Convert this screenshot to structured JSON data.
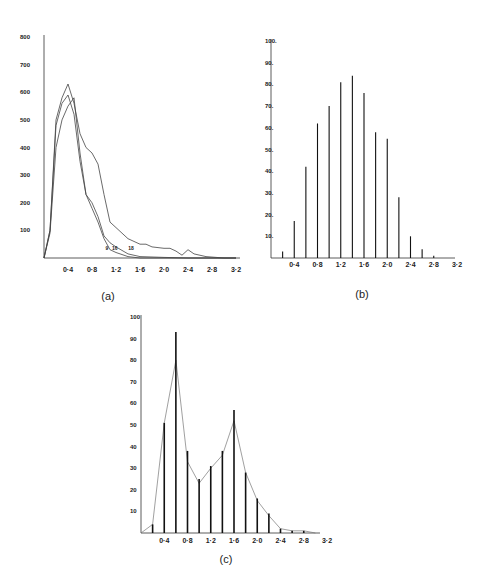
{
  "chart_data": [
    {
      "id": "a",
      "type": "line",
      "panel_label": "(a)",
      "title": "",
      "xlabel": "",
      "ylabel": "",
      "xlim": [
        0,
        3.2
      ],
      "ylim": [
        0,
        800
      ],
      "x_ticks": [
        "0·4",
        "0·8",
        "1·2",
        "1·6",
        "2·0",
        "2·4",
        "2·8",
        "3·2"
      ],
      "x_tick_values": [
        0.4,
        0.8,
        1.2,
        1.6,
        2.0,
        2.4,
        2.8,
        3.2
      ],
      "y_ticks": [
        "100",
        "200",
        "300",
        "400",
        "500",
        "600",
        "700",
        "800"
      ],
      "y_tick_values": [
        100,
        200,
        300,
        400,
        500,
        600,
        700,
        800
      ],
      "grid": false,
      "series": [
        {
          "name": "9",
          "x": [
            0,
            0.1,
            0.2,
            0.3,
            0.4,
            0.5,
            0.6,
            0.7,
            0.8,
            0.9,
            1.0,
            1.1,
            1.2,
            1.4,
            1.6,
            2.0,
            3.2
          ],
          "values": [
            0,
            100,
            480,
            560,
            590,
            520,
            350,
            230,
            180,
            130,
            70,
            30,
            20,
            5,
            0,
            0,
            0
          ],
          "label_pos": [
            1.05,
            30
          ]
        },
        {
          "name": "16",
          "x": [
            0,
            0.1,
            0.2,
            0.3,
            0.4,
            0.5,
            0.6,
            0.7,
            0.8,
            0.9,
            1.0,
            1.1,
            1.2,
            1.4,
            1.6,
            2.0,
            2.4,
            3.2
          ],
          "values": [
            0,
            90,
            400,
            500,
            550,
            580,
            380,
            230,
            200,
            150,
            80,
            55,
            40,
            15,
            5,
            2,
            0,
            0
          ],
          "label_pos": [
            1.18,
            30
          ]
        },
        {
          "name": "18",
          "x": [
            0,
            0.1,
            0.2,
            0.3,
            0.4,
            0.5,
            0.6,
            0.7,
            0.8,
            0.9,
            1.0,
            1.1,
            1.2,
            1.4,
            1.6,
            1.7,
            1.8,
            2.0,
            2.1,
            2.2,
            2.3,
            2.4,
            2.5,
            2.7,
            3.0,
            3.2
          ],
          "values": [
            0,
            100,
            500,
            580,
            630,
            560,
            450,
            400,
            380,
            340,
            230,
            130,
            110,
            70,
            50,
            50,
            40,
            35,
            35,
            25,
            10,
            30,
            15,
            5,
            0,
            0
          ],
          "label_pos": [
            1.45,
            30
          ]
        }
      ]
    },
    {
      "id": "b",
      "type": "bar",
      "panel_label": "(b)",
      "title": "",
      "xlabel": "",
      "ylabel": "",
      "xlim": [
        0,
        3.2
      ],
      "ylim": [
        0,
        100
      ],
      "x_ticks": [
        "0·4",
        "0·8",
        "1·2",
        "1·6",
        "2·0",
        "2·4",
        "2·8",
        "3·2"
      ],
      "x_tick_values": [
        0.4,
        0.8,
        1.2,
        1.6,
        2.0,
        2.4,
        2.8,
        3.2
      ],
      "y_ticks": [
        "10.",
        "20.",
        "30.",
        "40.",
        "50.",
        "60.",
        "70.",
        "80.",
        "90.",
        "100."
      ],
      "y_tick_values": [
        10,
        20,
        30,
        40,
        50,
        60,
        70,
        80,
        90,
        100
      ],
      "grid": false,
      "categories": [
        0.2,
        0.4,
        0.6,
        0.8,
        1.0,
        1.2,
        1.4,
        1.6,
        1.8,
        2.0,
        2.2,
        2.4,
        2.6,
        2.8
      ],
      "values": [
        3,
        17,
        42,
        62,
        70,
        81,
        84,
        76,
        58,
        55,
        28,
        10,
        4,
        1
      ]
    },
    {
      "id": "c",
      "type": "bar",
      "panel_label": "(c)",
      "title": "",
      "xlabel": "",
      "ylabel": "",
      "xlim": [
        0,
        3.2
      ],
      "ylim": [
        0,
        100
      ],
      "x_ticks": [
        "0·4",
        "0·8",
        "1·2",
        "1·6",
        "2·0",
        "2·4",
        "2·8",
        "3·2"
      ],
      "x_tick_values": [
        0.4,
        0.8,
        1.2,
        1.6,
        2.0,
        2.4,
        2.8,
        3.2
      ],
      "y_ticks": [
        "10",
        "20",
        "30",
        "40",
        "50",
        "60",
        "70",
        "80",
        "90",
        "100"
      ],
      "y_tick_values": [
        10,
        20,
        30,
        40,
        50,
        60,
        70,
        80,
        90,
        100
      ],
      "grid": false,
      "categories": [
        0.2,
        0.4,
        0.6,
        0.8,
        1.0,
        1.2,
        1.4,
        1.6,
        1.8,
        2.0,
        2.2,
        2.4,
        2.6,
        2.8
      ],
      "values": [
        4,
        51,
        93,
        38,
        25,
        31,
        38,
        57,
        28,
        16,
        9,
        2,
        1,
        1
      ],
      "series": [
        {
          "name": "fitted curve",
          "type": "line",
          "x": [
            0,
            0.2,
            0.4,
            0.6,
            0.8,
            1.0,
            1.2,
            1.4,
            1.6,
            1.8,
            2.0,
            2.2,
            2.4,
            2.6,
            2.8,
            3.0
          ],
          "values": [
            0,
            4,
            51,
            80,
            33,
            23,
            30,
            36,
            52,
            28,
            15,
            8,
            2,
            1,
            1,
            0
          ]
        }
      ]
    }
  ]
}
